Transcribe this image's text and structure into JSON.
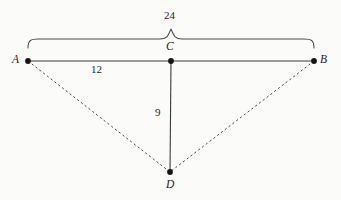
{
  "diagram": {
    "background_color": "#fbfbfa",
    "stroke_color": "#3a3a3a",
    "text_color": "#1d1d1d",
    "vertices": [
      {
        "id": "A",
        "label": "A",
        "x": 28,
        "y": 61,
        "marker": "filled-dot"
      },
      {
        "id": "B",
        "label": "B",
        "x": 314,
        "y": 61,
        "marker": "filled-dot"
      },
      {
        "id": "C",
        "label": "C",
        "x": 171,
        "y": 61,
        "marker": "filled-dot"
      },
      {
        "id": "D",
        "label": "D",
        "x": 170,
        "y": 172,
        "marker": "filled-dot"
      }
    ],
    "segments": [
      {
        "id": "AB",
        "from": "A",
        "to": "B",
        "style": "solid"
      },
      {
        "id": "CD",
        "from": "C",
        "to": "D",
        "style": "solid"
      },
      {
        "id": "AD",
        "from": "A",
        "to": "D",
        "style": "dashed"
      },
      {
        "id": "BD",
        "from": "B",
        "to": "D",
        "style": "dashed"
      }
    ],
    "brace": {
      "id": "brace-AB",
      "spans": "A to B",
      "orientation": "top",
      "left_x": 28,
      "right_x": 314,
      "peak_x": 171,
      "peak_y": 29,
      "baseline_y": 39,
      "tip_y": 48
    },
    "measurements": [
      {
        "id": "measure-AB",
        "value": "24",
        "labels_segment": "AB",
        "position": "above-brace"
      },
      {
        "id": "measure-AC",
        "value": "12",
        "labels_segment": "AC",
        "position": "below-segment"
      },
      {
        "id": "measure-CD",
        "value": "9",
        "labels_segment": "CD",
        "position": "left-of-segment"
      }
    ]
  }
}
